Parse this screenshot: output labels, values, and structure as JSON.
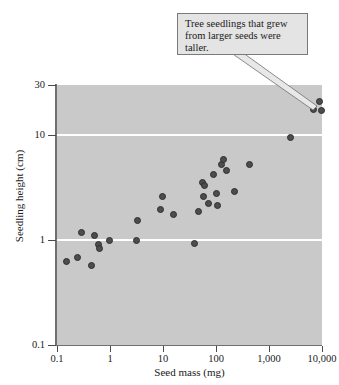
{
  "chart_data": {
    "type": "scatter",
    "title": "",
    "xlabel": "Seed mass (mg)",
    "ylabel": "Seedling height (cm)",
    "xscale": "log",
    "yscale": "log",
    "xlim": [
      0.1,
      10000
    ],
    "ylim": [
      0.1,
      30
    ],
    "xticks": [
      "0.1",
      "1",
      "10",
      "100",
      "1,000",
      "10,000"
    ],
    "xtick_values": [
      0.1,
      1,
      10,
      100,
      1000,
      10000
    ],
    "yticks": [
      "30",
      "10",
      "1",
      "0.1"
    ],
    "ytick_values": [
      30,
      10,
      1,
      0.1
    ],
    "gridlines": {
      "y": [
        10,
        1
      ],
      "color": "#ffffff"
    },
    "plot_background": "#c9c9c9",
    "point_color": "#4d4d4d",
    "legend": "none",
    "annotations": [
      {
        "text": "Tree seedlings that grew from larger seeds were taller.",
        "points_to": "top-right cluster of high seed mass, tall seedlings"
      }
    ],
    "points": [
      {
        "x": 0.15,
        "y": 0.62
      },
      {
        "x": 0.24,
        "y": 0.68
      },
      {
        "x": 0.29,
        "y": 1.17
      },
      {
        "x": 0.45,
        "y": 0.57
      },
      {
        "x": 0.5,
        "y": 1.1
      },
      {
        "x": 0.62,
        "y": 0.9
      },
      {
        "x": 0.63,
        "y": 0.83
      },
      {
        "x": 0.97,
        "y": 1.0
      },
      {
        "x": 3.1,
        "y": 1.0
      },
      {
        "x": 3.3,
        "y": 1.55
      },
      {
        "x": 9.0,
        "y": 1.95
      },
      {
        "x": 9.6,
        "y": 2.6
      },
      {
        "x": 15.5,
        "y": 1.75
      },
      {
        "x": 40.0,
        "y": 0.93
      },
      {
        "x": 46.0,
        "y": 1.85
      },
      {
        "x": 56.0,
        "y": 3.55
      },
      {
        "x": 58.0,
        "y": 2.6
      },
      {
        "x": 62.0,
        "y": 3.3
      },
      {
        "x": 72.0,
        "y": 2.25
      },
      {
        "x": 88.0,
        "y": 4.2
      },
      {
        "x": 100.0,
        "y": 2.8
      },
      {
        "x": 105.0,
        "y": 2.15
      },
      {
        "x": 128.0,
        "y": 5.3
      },
      {
        "x": 138.0,
        "y": 5.8
      },
      {
        "x": 160.0,
        "y": 4.6
      },
      {
        "x": 225.0,
        "y": 2.9
      },
      {
        "x": 420.0,
        "y": 5.3
      },
      {
        "x": 2600.0,
        "y": 9.5
      },
      {
        "x": 7000.0,
        "y": 17.5
      },
      {
        "x": 8800.0,
        "y": 21.0
      },
      {
        "x": 9700.0,
        "y": 17.0
      }
    ]
  }
}
